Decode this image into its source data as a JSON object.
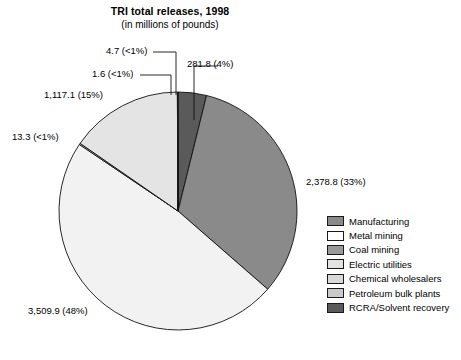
{
  "title": {
    "main": "TRI total releases, 1998",
    "sub": "(in millions of pounds)"
  },
  "legend": {
    "items": [
      {
        "label": "Manufacturing",
        "color": "#8a8a8a"
      },
      {
        "label": "Metal mining",
        "color": "#ffffff"
      },
      {
        "label": "Coal mining",
        "color": "#9a9a9a"
      },
      {
        "label": "Electric utilities",
        "color": "#e2e2e2"
      },
      {
        "label": "Chemical wholesalers",
        "color": "#d8d8d8"
      },
      {
        "label": "Petroleum bulk plants",
        "color": "#c9c9c9"
      },
      {
        "label": "RCRA/Solvent recovery",
        "color": "#5a5a5a"
      }
    ]
  },
  "callouts": {
    "rcra": "281.8 (4%)",
    "electric": "4.7 (<1%)",
    "coal": "1.6 (<1%)",
    "metal": "1,117.1 (15%)",
    "petroleum": "13.3 (<1%)",
    "chemical": "3,509.9 (48%)",
    "manufacturing": "2,378.8 (33%)"
  },
  "chart_data": {
    "type": "pie",
    "title": "TRI total releases, 1998",
    "subtitle": "(in millions of pounds)",
    "unit": "millions of pounds",
    "total": 7307.2,
    "grid": false,
    "legend_position": "right",
    "start_angle_deg": 0,
    "direction": "clockwise",
    "categories": [
      "RCRA/Solvent recovery",
      "Manufacturing",
      "Chemical wholesalers",
      "Petroleum bulk plants",
      "Metal mining",
      "Coal mining",
      "Electric utilities"
    ],
    "values": [
      281.8,
      2378.8,
      3509.9,
      13.3,
      1117.1,
      1.6,
      4.7
    ],
    "percent_labels": [
      "4%",
      "33%",
      "48%",
      "<1%",
      "15%",
      "<1%",
      "<1%"
    ],
    "data_labels": [
      "281.8 (4%)",
      "2,378.8 (33%)",
      "3,509.9 (48%)",
      "13.3 (<1%)",
      "1,117.1 (15%)",
      "1.6 (<1%)",
      "4.7 (<1%)"
    ],
    "slice_colors": [
      "#5a5a5a",
      "#8a8a8a",
      "#f2f2f2",
      "#c9c9c9",
      "#e4e4e4",
      "#9a9a9a",
      "#e2e2e2"
    ]
  }
}
